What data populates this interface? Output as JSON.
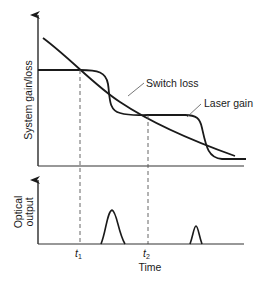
{
  "diagram": {
    "type": "q-switching timing diagram",
    "top_panel": {
      "y_axis_label": "System gain/loss",
      "curves": [
        {
          "name": "Switch loss",
          "label": "Switch loss",
          "shape": "monotonic decreasing line"
        },
        {
          "name": "Laser gain",
          "label": "Laser gain",
          "shape": "stepwise decreasing S-curves"
        }
      ]
    },
    "bottom_panel": {
      "y_axis_label_line1": "Optical",
      "y_axis_label_line2": "output",
      "pulses": [
        {
          "position": "after t1",
          "relative_height": "tall"
        },
        {
          "position": "after t2",
          "relative_height": "short"
        }
      ]
    },
    "x_axis_label": "Time",
    "markers": [
      {
        "name": "t1",
        "base": "t",
        "subscript": "1"
      },
      {
        "name": "t2",
        "base": "t",
        "subscript": "2"
      }
    ],
    "colors": {
      "line": "#1a1a1a",
      "dashed": "#555555",
      "axis": "#333333",
      "background": "#ffffff"
    }
  }
}
